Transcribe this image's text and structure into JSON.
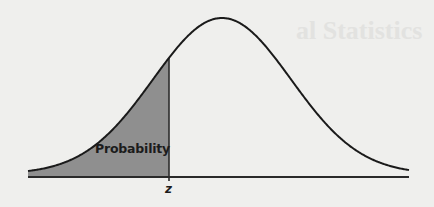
{
  "figure": {
    "region_label": "Probability",
    "axis_marker_label": "z",
    "colors": {
      "background": "#efefed",
      "curve": "#1a1a1a",
      "shaded_region": "#8f8f8f",
      "axis": "#2a2a2a"
    }
  },
  "background_bleed": {
    "title_fragment": "al Statistics",
    "lines": [
      "",
      "",
      "",
      ""
    ]
  },
  "chart_data": {
    "type": "area",
    "title": "",
    "distribution": "normal",
    "shaded_region": {
      "from": "-inf",
      "to": "z",
      "label": "Probability"
    },
    "xlabel": "",
    "ylabel": "",
    "x_tick_labels": [
      "z"
    ],
    "z_position_sd": -0.77,
    "grid": false,
    "legend": null
  }
}
